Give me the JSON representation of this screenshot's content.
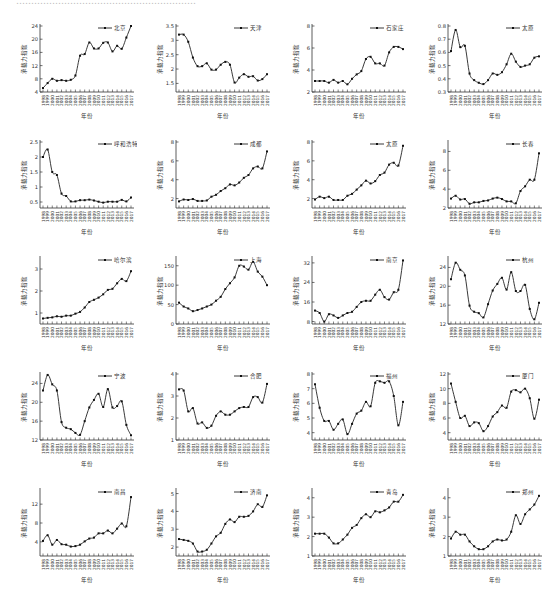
{
  "header_fragment": "……………………………………………………",
  "common": {
    "ylabel": "承载力指数",
    "xlabel": "年份",
    "years": [
      "1998",
      "1999",
      "2000",
      "2001",
      "2002",
      "2003",
      "2004",
      "2005",
      "2006",
      "2007",
      "2008",
      "2009",
      "2010",
      "2011",
      "2012",
      "2013",
      "2014",
      "2015",
      "2016",
      "2017"
    ]
  },
  "chart_data": [
    {
      "type": "line",
      "title": "北京",
      "legend": "北京",
      "ylim": [
        4,
        24
      ],
      "yticks": [
        4,
        8,
        12,
        16,
        20,
        24
      ],
      "values": [
        5.2,
        6.7,
        8.0,
        7.4,
        7.6,
        7.4,
        7.7,
        9.0,
        15.0,
        15.5,
        19.0,
        17.2,
        17.2,
        18.9,
        19.0,
        16.3,
        18.0,
        17.1,
        20.5,
        24.0
      ]
    },
    {
      "type": "line",
      "title": "天津",
      "legend": "天津",
      "ylim": [
        1.2,
        3.5
      ],
      "yticks": [
        1.5,
        2.0,
        2.5,
        3.0,
        3.5
      ],
      "values": [
        3.2,
        3.2,
        2.95,
        2.4,
        2.1,
        2.1,
        2.2,
        1.98,
        1.98,
        2.15,
        2.25,
        2.15,
        1.53,
        1.7,
        1.82,
        1.73,
        1.75,
        1.6,
        1.65,
        1.82
      ]
    },
    {
      "type": "line",
      "title": "石家庄",
      "legend": "石家庄",
      "ylim": [
        2,
        8
      ],
      "yticks": [
        2,
        4,
        6,
        8
      ],
      "values": [
        3.0,
        3.0,
        3.0,
        2.85,
        3.1,
        2.85,
        3.0,
        2.7,
        3.2,
        3.6,
        3.9,
        5.0,
        5.2,
        4.6,
        4.6,
        4.4,
        5.6,
        6.1,
        6.1,
        5.9,
        7.0
      ]
    },
    {
      "type": "line",
      "title": "太原",
      "legend": "太原",
      "ylim": [
        0.3,
        0.8
      ],
      "yticks": [
        0.3,
        0.4,
        0.5,
        0.6,
        0.7,
        0.8
      ],
      "values": [
        0.61,
        0.77,
        0.64,
        0.65,
        0.44,
        0.39,
        0.37,
        0.36,
        0.39,
        0.44,
        0.43,
        0.45,
        0.51,
        0.59,
        0.53,
        0.49,
        0.5,
        0.51,
        0.56,
        0.57,
        0.55,
        0.7
      ]
    },
    {
      "type": "line",
      "title": "呼和浩特",
      "legend": "呼和浩特",
      "ylim": [
        0.3,
        2.5
      ],
      "yticks": [
        0.5,
        1.0,
        1.5,
        2.0,
        2.5
      ],
      "values": [
        2.0,
        2.25,
        1.5,
        1.4,
        0.78,
        0.7,
        0.52,
        0.52,
        0.56,
        0.56,
        0.58,
        0.55,
        0.51,
        0.48,
        0.51,
        0.51,
        0.51,
        0.57,
        0.52,
        0.65
      ]
    },
    {
      "type": "line",
      "title": "成都",
      "legend": "成都",
      "ylim": [
        1,
        8
      ],
      "yticks": [
        2,
        4,
        6,
        8
      ],
      "values": [
        1.7,
        1.9,
        1.85,
        1.95,
        1.75,
        1.75,
        1.8,
        2.2,
        2.4,
        2.8,
        3.1,
        3.5,
        3.4,
        3.7,
        4.2,
        4.5,
        5.2,
        5.4,
        5.2,
        7.0
      ]
    },
    {
      "type": "line",
      "title": "太原",
      "legend": "太原",
      "ylim": [
        1,
        8
      ],
      "yticks": [
        2,
        4,
        6,
        8
      ],
      "values": [
        1.9,
        2.2,
        2.05,
        2.2,
        1.85,
        1.85,
        1.85,
        2.3,
        2.5,
        2.95,
        3.4,
        3.9,
        3.6,
        3.85,
        4.5,
        4.75,
        5.6,
        5.8,
        5.5,
        7.6
      ]
    },
    {
      "type": "line",
      "title": "长春",
      "legend": "长春",
      "ylim": [
        2,
        9
      ],
      "yticks": [
        2,
        4,
        6,
        8
      ],
      "values": [
        3.0,
        3.3,
        2.9,
        2.95,
        2.45,
        2.6,
        2.6,
        2.75,
        2.8,
        3.0,
        3.1,
        2.95,
        2.7,
        2.7,
        2.5,
        3.8,
        4.3,
        5.0,
        5.0,
        7.8
      ]
    },
    {
      "type": "line",
      "title": "哈尔滨",
      "legend": "哈尔滨",
      "ylim": [
        0.5,
        3.5
      ],
      "yticks": [
        1,
        2,
        3
      ],
      "values": [
        0.75,
        0.78,
        0.8,
        0.85,
        0.83,
        0.88,
        0.88,
        0.97,
        1.05,
        1.25,
        1.5,
        1.6,
        1.7,
        1.85,
        2.05,
        2.1,
        2.35,
        2.55,
        2.45,
        2.9
      ]
    },
    {
      "type": "line",
      "title": "上海",
      "legend": "上海",
      "ylim": [
        0,
        170
      ],
      "yticks": [
        0,
        50,
        100,
        150
      ],
      "values": [
        55,
        45,
        40,
        33,
        36,
        40,
        45,
        50,
        60,
        70,
        90,
        105,
        120,
        150,
        148,
        140,
        160,
        135,
        122,
        100
      ]
    },
    {
      "type": "line",
      "title": "南京",
      "legend": "南京",
      "ylim": [
        7,
        34
      ],
      "yticks": [
        8,
        16,
        24,
        32
      ],
      "values": [
        12.5,
        11.5,
        8.0,
        11.0,
        10.5,
        9.5,
        10.5,
        11.5,
        12.0,
        14.0,
        16.0,
        16.5,
        16.5,
        19.0,
        21.0,
        18.0,
        17.0,
        20.0,
        21.0,
        33.0
      ]
    },
    {
      "type": "line",
      "title": "杭州",
      "legend": "杭州",
      "ylim": [
        12,
        26
      ],
      "yticks": [
        12,
        16,
        20,
        24
      ],
      "values": [
        21.5,
        25.0,
        23.5,
        22.3,
        15.9,
        14.6,
        14.3,
        13.4,
        16.2,
        19.1,
        20.5,
        21.8,
        19.3,
        23.0,
        19.0,
        19.0,
        20.3,
        15.2,
        13.0,
        16.5
      ]
    },
    {
      "type": "line",
      "title": "宁波",
      "legend": "宁波",
      "ylim": [
        12,
        26
      ],
      "yticks": [
        12,
        16,
        20,
        24
      ],
      "values": [
        22.5,
        25.8,
        23.8,
        22.5,
        15.8,
        14.6,
        14.3,
        13.5,
        13.1,
        16.0,
        18.9,
        20.5,
        21.8,
        19.0,
        22.8,
        18.9,
        19.2,
        20.2,
        15.2,
        13.0,
        16.5
      ]
    },
    {
      "type": "line",
      "title": "合肥",
      "legend": "合肥",
      "ylim": [
        1,
        4
      ],
      "yticks": [
        1,
        2,
        3,
        4
      ],
      "values": [
        3.3,
        3.25,
        2.3,
        2.45,
        1.75,
        1.8,
        1.55,
        1.65,
        2.1,
        2.3,
        2.15,
        2.15,
        2.3,
        2.45,
        2.5,
        2.5,
        2.95,
        2.95,
        2.7,
        3.55
      ]
    },
    {
      "type": "line",
      "title": "福州",
      "legend": "福州",
      "ylim": [
        3.5,
        8
      ],
      "yticks": [
        4,
        5,
        6,
        7,
        8
      ],
      "values": [
        7.3,
        5.7,
        4.8,
        4.8,
        4.2,
        4.6,
        4.9,
        3.9,
        4.6,
        5.3,
        5.5,
        6.1,
        5.8,
        7.4,
        7.5,
        7.4,
        7.5,
        6.5,
        4.5,
        6.1
      ]
    },
    {
      "type": "line",
      "title": "厦门",
      "legend": "厦门",
      "ylim": [
        3,
        12
      ],
      "yticks": [
        4,
        6,
        8,
        10,
        12
      ],
      "values": [
        10.7,
        8.2,
        6.0,
        6.3,
        4.9,
        5.4,
        5.3,
        4.2,
        4.9,
        6.2,
        6.8,
        7.7,
        7.4,
        9.6,
        9.8,
        9.5,
        10.0,
        8.7,
        5.9,
        8.5
      ]
    },
    {
      "type": "line",
      "title": "南昌",
      "legend": "南昌",
      "ylim": [
        1,
        15
      ],
      "yticks": [
        4,
        8,
        12
      ],
      "values": [
        4.2,
        5.4,
        3.4,
        4.4,
        3.5,
        3.4,
        3.0,
        3.1,
        3.4,
        4.1,
        4.7,
        4.9,
        5.8,
        5.8,
        6.4,
        5.8,
        6.8,
        7.9,
        7.3,
        13.5
      ]
    },
    {
      "type": "line",
      "title": "济南",
      "legend": "济南",
      "ylim": [
        1.5,
        5.2
      ],
      "yticks": [
        2,
        3,
        4,
        5
      ],
      "values": [
        2.45,
        2.4,
        2.35,
        2.2,
        1.75,
        1.75,
        1.85,
        2.2,
        2.6,
        2.8,
        3.3,
        3.55,
        3.4,
        3.7,
        3.7,
        3.75,
        4.0,
        4.4,
        4.25,
        4.9
      ]
    },
    {
      "type": "line",
      "title": "青岛",
      "legend": "青岛",
      "ylim": [
        1,
        4.4
      ],
      "yticks": [
        1,
        2,
        3,
        4
      ],
      "values": [
        2.15,
        2.15,
        2.15,
        1.95,
        1.65,
        1.65,
        1.85,
        2.1,
        2.45,
        2.6,
        2.95,
        3.15,
        3.0,
        3.3,
        3.25,
        3.35,
        3.5,
        3.8,
        3.8,
        4.15
      ]
    },
    {
      "type": "line",
      "title": "郑州",
      "legend": "郑州",
      "ylim": [
        1,
        4.4
      ],
      "yticks": [
        1,
        2,
        3,
        4
      ],
      "values": [
        1.9,
        2.25,
        2.1,
        2.1,
        1.75,
        1.5,
        1.35,
        1.35,
        1.5,
        1.75,
        1.85,
        1.8,
        1.85,
        2.25,
        3.1,
        2.65,
        3.15,
        3.4,
        3.65,
        4.1
      ]
    }
  ]
}
